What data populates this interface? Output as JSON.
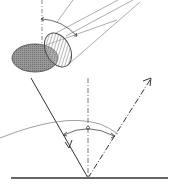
{
  "diagram": {
    "colors": {
      "line": "#333333",
      "thin_line": "#777777",
      "ellipse_fill": "#8a8a8a",
      "hatch": "#444444",
      "background": "#ffffff"
    },
    "elements": [
      {
        "id": "light-source-disk",
        "kind": "hatched-ellipse",
        "description": "tilted hatched disk representing source aperture"
      },
      {
        "id": "projected-ellipse",
        "kind": "shaded-ellipse",
        "description": "shaded ellipse projection"
      },
      {
        "id": "light-beam-lines",
        "kind": "lines",
        "count": 4
      },
      {
        "id": "upper-normal",
        "kind": "dash-dot-line"
      },
      {
        "id": "upper-angle-arc",
        "kind": "arc-with-arrows"
      },
      {
        "id": "incident-ray",
        "kind": "arrow-line",
        "direction": "down"
      },
      {
        "id": "reflected-ray",
        "kind": "dash-dot-arrow-line",
        "direction": "up"
      },
      {
        "id": "surface-normal",
        "kind": "dash-dot-line"
      },
      {
        "id": "lower-angle-arc",
        "kind": "arc-with-arrows"
      },
      {
        "id": "distribution-curve",
        "kind": "curve"
      },
      {
        "id": "surface",
        "kind": "thick-line"
      }
    ]
  }
}
